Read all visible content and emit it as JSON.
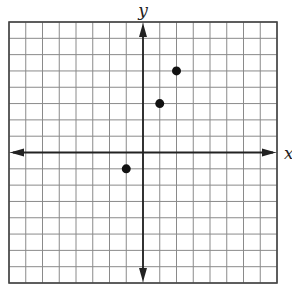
{
  "chart_data": {
    "type": "scatter",
    "title": "",
    "xlabel": "x",
    "ylabel": "y",
    "xlim": [
      -8,
      8
    ],
    "ylim": [
      -8,
      8
    ],
    "grid": true,
    "grid_step": 1,
    "tick_labels_shown": false,
    "axes_arrows": true,
    "legend": null,
    "series": [
      {
        "name": "points",
        "points": [
          {
            "x": 2,
            "y": 5
          },
          {
            "x": 1,
            "y": 3
          },
          {
            "x": -1,
            "y": -1
          }
        ]
      }
    ]
  },
  "colors": {
    "grid": "#8a8a8a",
    "border": "#444444",
    "axis": "#222222",
    "point": "#111111"
  }
}
